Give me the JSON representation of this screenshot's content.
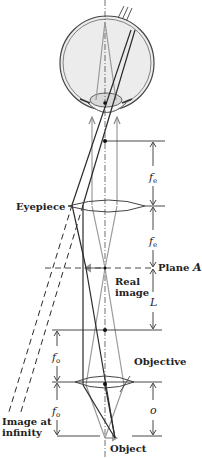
{
  "diagram": {
    "type": "compound-microscope-ray-diagram",
    "labels": {
      "eyepiece": "Eyepiece",
      "plane": "Plane ",
      "plane_letter": "A",
      "real_image_line1": "Real",
      "real_image_line2": "image",
      "objective": "Objective",
      "image_at_infinity_line1": "Image at",
      "image_at_infinity_line2": "infinity",
      "object": "Object"
    },
    "dimensions": {
      "fe": {
        "symbol": "f",
        "subscript": "e"
      },
      "fo": {
        "symbol": "f",
        "subscript": "o"
      },
      "L": {
        "symbol": "L"
      },
      "o": {
        "symbol": "o"
      }
    },
    "colors": {
      "line_dark": "#2a2a2a",
      "line_gray": "#9a9a9a",
      "eye_fill": "#ececec",
      "background": "#ffffff"
    }
  }
}
